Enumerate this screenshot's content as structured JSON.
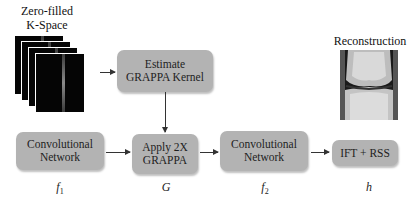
{
  "input": {
    "title_line1": "Zero-filled",
    "title_line2": "K-Space"
  },
  "output": {
    "title": "Reconstruction"
  },
  "boxes": {
    "estimate_line1": "Estimate",
    "estimate_line2": "GRAPPA Kernel",
    "conv1_line1": "Convolutional",
    "conv1_line2": "Network",
    "apply_line1": "Apply 2X",
    "apply_line2": "GRAPPA",
    "conv2_line1": "Convolutional",
    "conv2_line2": "Network",
    "ift": "IFT + RSS"
  },
  "symbols": {
    "f1_base": "f",
    "f1_sub": "1",
    "g": "G",
    "f2_base": "f",
    "f2_sub": "2",
    "h": "h"
  },
  "colors": {
    "box_fill": "#b3b3b3",
    "arrow": "#333333",
    "background": "#ffffff"
  }
}
